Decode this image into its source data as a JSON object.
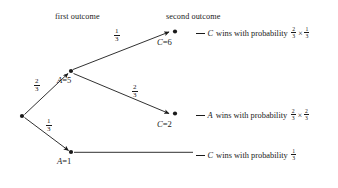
{
  "figure": {
    "type": "probability-tree-diagram",
    "headers": {
      "first": "first outcome",
      "second": "second outcome"
    },
    "nodes": {
      "root": {
        "label": "",
        "x": 22,
        "y": 116
      },
      "a5": {
        "var": "A",
        "eq": "=",
        "value": "5",
        "label": "A = 5",
        "x": 71,
        "y": 71
      },
      "a1": {
        "var": "A",
        "eq": "=",
        "value": "1",
        "label": "A = 1",
        "x": 71,
        "y": 152
      },
      "c6": {
        "var": "C",
        "eq": "=",
        "value": "6",
        "label": "C = 6",
        "x": 172,
        "y": 33
      },
      "c2": {
        "var": "C",
        "eq": "=",
        "value": "2",
        "label": "C = 2",
        "x": 172,
        "y": 115
      }
    },
    "edges": [
      {
        "name": "root-to-a5",
        "numerator": "2",
        "denominator": "3",
        "label": "2/3"
      },
      {
        "name": "root-to-a1",
        "numerator": "1",
        "denominator": "3",
        "label": "1/3"
      },
      {
        "name": "a5-to-c6",
        "numerator": "1",
        "denominator": "3",
        "label": "1/3"
      },
      {
        "name": "a5-to-c2",
        "numerator": "2",
        "denominator": "3",
        "label": "2/3"
      }
    ],
    "outcomes": [
      {
        "name": "outcome-c-wins-top",
        "winner": "C",
        "text": "wins with probability",
        "prob_terms": [
          {
            "numerator": "2",
            "denominator": "3"
          },
          {
            "numerator": "1",
            "denominator": "3"
          }
        ],
        "operator": "×",
        "full": "C wins with probability 2/3 × 1/3"
      },
      {
        "name": "outcome-a-wins-mid",
        "winner": "A",
        "text": "wins with probability",
        "prob_terms": [
          {
            "numerator": "2",
            "denominator": "3"
          },
          {
            "numerator": "2",
            "denominator": "3"
          }
        ],
        "operator": "×",
        "full": "A wins with probability 2/3 × 2/3"
      },
      {
        "name": "outcome-c-wins-bottom",
        "winner": "C",
        "text": "wins with probability",
        "prob_terms": [
          {
            "numerator": "1",
            "denominator": "3"
          }
        ],
        "operator": "",
        "full": "C wins with probability 1/3"
      }
    ],
    "colors": {
      "ink": "#1a1a1a",
      "background": "#ffffff"
    }
  }
}
